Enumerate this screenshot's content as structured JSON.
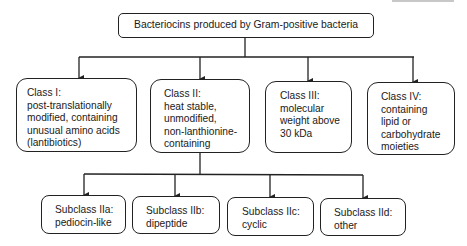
{
  "root": {
    "label": "Bacteriocins produced by Gram-positive bacteria"
  },
  "classes": [
    {
      "title": "Class I:",
      "lines": [
        "post-translationally",
        "modified, containing",
        "unusual amino acids",
        "(lantibiotics)"
      ]
    },
    {
      "title": "Class II:",
      "lines": [
        "heat stable,",
        "unmodified,",
        "non-lanthionine-",
        "containing"
      ]
    },
    {
      "title": "Class III:",
      "lines": [
        "molecular",
        "weight above",
        "30 kDa"
      ]
    },
    {
      "title": "Class IV:",
      "lines": [
        "containing",
        "lipid or",
        "carbohydrate",
        "moieties"
      ]
    }
  ],
  "subclasses": [
    {
      "title": "Subclass IIa:",
      "lines": [
        "pediocin-like"
      ]
    },
    {
      "title": "Subclass IIb:",
      "lines": [
        "dipeptide"
      ]
    },
    {
      "title": "Subclass IIc:",
      "lines": [
        "cyclic"
      ]
    },
    {
      "title": "Subclass IId:",
      "lines": [
        "other"
      ]
    }
  ],
  "colors": {
    "stroke": "#222222",
    "background": "#ffffff",
    "text": "#1a1a1a"
  }
}
